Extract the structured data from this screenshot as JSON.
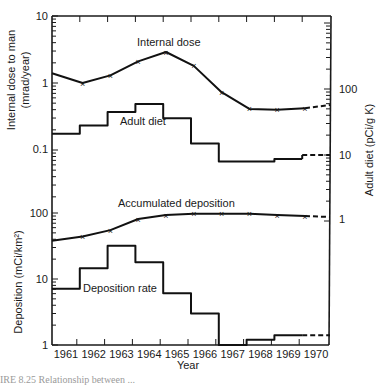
{
  "chart_data": {
    "type": "line",
    "title": "",
    "xlabel": "Year",
    "categories": [
      "1961",
      "1962",
      "1963",
      "1964",
      "1965",
      "1966",
      "1967",
      "1968",
      "1969",
      "1970"
    ],
    "panels": [
      {
        "name": "upper",
        "ylabel_left": "Internal dose to man (mrad/year)",
        "ylabel_right": "Adult diet (pCi/g K)",
        "yscale": "log",
        "ylim_left": [
          0.03,
          10
        ],
        "left_ticks": [
          "10",
          "1",
          "0.1"
        ],
        "right_ticks": [
          "100",
          "10",
          "1"
        ],
        "series": [
          {
            "name": "Internal dose",
            "style": "line-with-x-markers",
            "axis": "left",
            "x": [
              1960.5,
              1961.6,
              1962.6,
              1963.6,
              1964.6,
              1965.6,
              1966.6,
              1967.6,
              1968.6,
              1969.6,
              1970.6
            ],
            "values": [
              1.4,
              1.0,
              1.3,
              2.1,
              2.9,
              1.8,
              0.73,
              0.41,
              0.4,
              0.42,
              0.47
            ],
            "dashed_from_index": 9
          },
          {
            "name": "Adult diet",
            "style": "step",
            "axis": "right",
            "values": [
              21,
              28,
              45,
              59,
              36,
              15,
              8,
              8,
              8.7,
              10
            ],
            "dashed_from_index": 9
          }
        ]
      },
      {
        "name": "lower",
        "ylabel_left": "Deposition (mCi/km²)",
        "yscale": "log",
        "ylim_left": [
          1,
          300
        ],
        "left_ticks": [
          "100",
          "10",
          "1"
        ],
        "series": [
          {
            "name": "Accumulated deposition",
            "style": "line-with-x-markers",
            "axis": "left",
            "x": [
              1960.5,
              1961.6,
              1962.6,
              1963.6,
              1964.6,
              1965.6,
              1966.6,
              1967.6,
              1968.6,
              1969.6,
              1970.6
            ],
            "values": [
              38,
              44,
              55,
              81,
              93,
              97,
              97,
              97,
              93,
              90,
              87
            ],
            "dashed_from_index": 9
          },
          {
            "name": "Deposition rate",
            "style": "step",
            "axis": "left",
            "values": [
              7.1,
              14.5,
              32,
              18,
              6.1,
              3.0,
              1.0,
              1.2,
              1.4,
              1.4
            ],
            "dashed_from_index": 9
          }
        ]
      }
    ],
    "grid": false,
    "legend": "inline labels"
  },
  "labels": {
    "internal_dose": "Internal dose",
    "adult_diet": "Adult diet",
    "accumulated_deposition": "Accumulated deposition",
    "deposition_rate": "Deposition rate",
    "ylabel_upper_left_1": "Internal dose to man",
    "ylabel_upper_left_2": "(mrad/year)",
    "ylabel_right": "Adult diet  (pCi/g K)",
    "ylabel_lower_left": "Deposition (mCi/km²)",
    "xlabel": "Year",
    "left_ticks": [
      "10",
      "1",
      "0.1",
      "100",
      "10",
      "1"
    ],
    "right_ticks": [
      "100",
      "10",
      "1"
    ],
    "years": [
      "1961",
      "1962",
      "1963",
      "1964",
      "1965",
      "1966",
      "1967",
      "1968",
      "1969",
      "1970"
    ],
    "caption": "IRE 8.25   Relationship between ..."
  }
}
